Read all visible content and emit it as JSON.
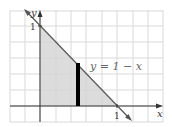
{
  "figure": {
    "curve_label": "y = 1 − x",
    "x_axis_label": "x",
    "y_axis_label": "y",
    "x_tick_label": "1",
    "y_tick_label": "1"
  },
  "colors": {
    "grid": "#d9d9d9",
    "fill": "#d6d6d6",
    "axis": "#333333",
    "curve": "#555555",
    "bar": "#000000"
  }
}
